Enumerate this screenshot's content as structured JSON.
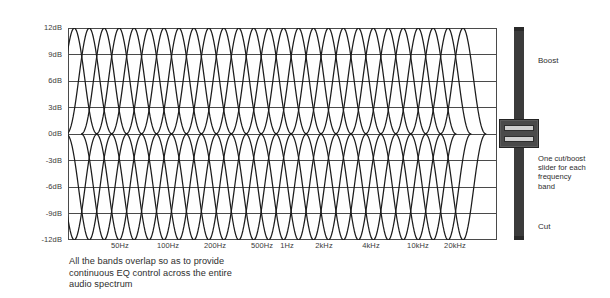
{
  "chart_data": {
    "type": "line",
    "title": "",
    "xlabel": "",
    "ylabel": "",
    "ylim": [
      -12,
      12
    ],
    "grid": true,
    "legend": "none",
    "y_ticks": [
      "12dB",
      "9dB",
      "6dB",
      "3dB",
      "0dB",
      "-3dB",
      "-6dB",
      "-9dB",
      "-12dB"
    ],
    "y_tick_values": [
      12,
      9,
      6,
      3,
      0,
      -3,
      -6,
      -9,
      -12
    ],
    "x_ticks": [
      "50Hz",
      "100Hz",
      "200Hz",
      "500Hz",
      "1Hz",
      "2kHz",
      "4kHz",
      "10kHz",
      "20kHz"
    ],
    "x_tick_px": [
      120,
      168,
      215,
      262,
      287,
      324,
      371,
      418,
      455
    ],
    "band_count": 27,
    "peak_db": 12,
    "trough_db": -12,
    "series": [
      {
        "name": "Band boost curves",
        "peak": 12
      },
      {
        "name": "Band cut curves",
        "peak": -12
      }
    ]
  },
  "caption": {
    "line1": "All the bands overlap so as to provide",
    "line2": "continuous EQ control across the entire",
    "line3": "audio spectrum"
  },
  "fader": {
    "boost_label": "Boost",
    "cut_label": "Cut",
    "note_line1": "One cut/boost",
    "note_line2": "slider for each",
    "note_line3": "frequency",
    "note_line4": "band"
  },
  "colors": {
    "background": "#ffffff",
    "curve": "#1c1c1c",
    "grid": "#4a4a4a",
    "text": "#2e2e2e",
    "fader_track": "#3b3b3b",
    "fader_knob": "#4a4a4a",
    "knob_slot": "#cfcfcf"
  }
}
